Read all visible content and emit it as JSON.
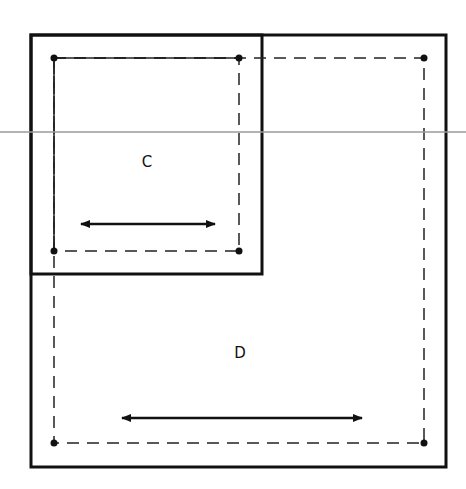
{
  "diagram": {
    "type": "nested-rectangles",
    "colors": {
      "stroke": "#111111",
      "reference_line": "#9a9a9a",
      "background": "#ffffff"
    },
    "reference_line": {
      "y": 132
    },
    "regions": [
      {
        "id": "C",
        "label": "C",
        "outer_box": {
          "x1": 31,
          "y1": 35,
          "x2": 262,
          "y2": 274
        },
        "dashed_box": {
          "x1": 54,
          "y1": 58,
          "x2": 239,
          "y2": 251
        },
        "corner_dots": 4,
        "arrow": {
          "type": "double-headed",
          "x1": 81,
          "x2": 215,
          "y": 224
        }
      },
      {
        "id": "D",
        "label": "D",
        "outer_box": {
          "x1": 31,
          "y1": 35,
          "x2": 446,
          "y2": 467
        },
        "dashed_box": {
          "x1": 54,
          "y1": 58,
          "x2": 424,
          "y2": 443
        },
        "corner_dots": 4,
        "arrow": {
          "type": "double-headed",
          "x1": 122,
          "x2": 362,
          "y": 418
        }
      }
    ]
  }
}
